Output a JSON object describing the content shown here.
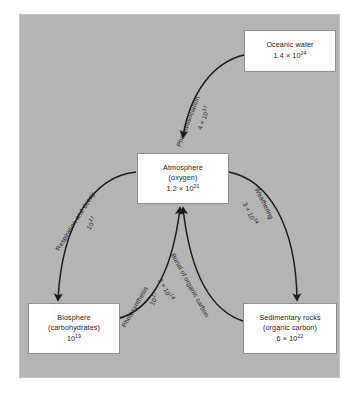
{
  "figure": {
    "background_color": "#b4b4b4",
    "box_fill": "#ffffff",
    "ink_color": "#1b1b1b"
  },
  "nodes": [
    {
      "id": "oceanic-water",
      "title": "Oceanic water",
      "subtitle": "",
      "value_mantissa": "1.4 × 10",
      "value_exponent": "24"
    },
    {
      "id": "atmosphere",
      "title": "Atmosphere",
      "subtitle": "(oxygen)",
      "value_mantissa": "1.2 × 10",
      "value_exponent": "21"
    },
    {
      "id": "biosphere",
      "title": "Biosphere",
      "subtitle": "(carbohydrates)",
      "value_mantissa": "10",
      "value_exponent": "19"
    },
    {
      "id": "sedimentary-rocks",
      "title": "Sedimentary rocks",
      "subtitle": "(organic carbon)",
      "value_mantissa": "6 × 10",
      "value_exponent": "22"
    }
  ],
  "flows": [
    {
      "id": "photodissociation",
      "label": "Photodissociation",
      "value_mantissa": "4 × 10",
      "value_exponent": "17",
      "from": "oceanic-water",
      "to": "atmosphere"
    },
    {
      "id": "respiration-and-decay",
      "label": "Respiration and decay",
      "value_mantissa": "10",
      "value_exponent": "17",
      "from": "atmosphere",
      "to": "biosphere"
    },
    {
      "id": "weathering",
      "label": "Weathering",
      "value_mantissa": "3 × 10",
      "value_exponent": "14",
      "from": "atmosphere",
      "to": "sedimentary-rocks"
    },
    {
      "id": "photosynthesis",
      "label": "Photosynthesis",
      "value_mantissa": "10",
      "value_exponent": "17",
      "from": "biosphere",
      "to": "atmosphere"
    },
    {
      "id": "burial-of-organic-carbon",
      "label": "Burial of organic carbon",
      "value_mantissa": "3 × 10",
      "value_exponent": "14",
      "from": "sedimentary-rocks",
      "to": "atmosphere"
    }
  ]
}
